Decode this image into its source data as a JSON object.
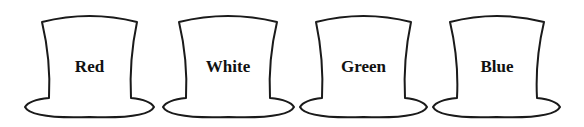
{
  "hats": [
    {
      "label": "Red",
      "crown": {
        "tl": 42,
        "tr": 137,
        "bl": 49,
        "br": 131
      },
      "brim": {
        "l": 25,
        "r": 154
      }
    },
    {
      "label": "White",
      "crown": {
        "tl": 179,
        "tr": 277,
        "bl": 186,
        "br": 270
      },
      "brim": {
        "l": 163,
        "r": 294
      }
    },
    {
      "label": "Green",
      "crown": {
        "tl": 316,
        "tr": 411,
        "bl": 322,
        "br": 405
      },
      "brim": {
        "l": 300,
        "r": 427
      }
    },
    {
      "label": "Blue",
      "crown": {
        "tl": 450,
        "tr": 544,
        "bl": 457,
        "br": 537
      },
      "brim": {
        "l": 433,
        "r": 560
      }
    }
  ],
  "colors": {
    "stroke": "#1a1a1a",
    "fill": "#ffffff",
    "text": "#111111"
  }
}
